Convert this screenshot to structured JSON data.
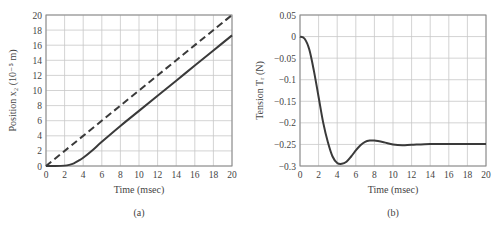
{
  "chart_data": [
    {
      "type": "line",
      "panel_label": "(a)",
      "title": "",
      "xlabel": "Time (msec)",
      "ylabel": "Position x₂ (10⁻⁵ m)",
      "xlim": [
        0,
        20
      ],
      "ylim": [
        0,
        20
      ],
      "xticks": [
        "0",
        "2",
        "4",
        "6",
        "8",
        "10",
        "12",
        "14",
        "16",
        "18",
        "20"
      ],
      "yticks": [
        "0",
        "2",
        "4",
        "6",
        "8",
        "10",
        "12",
        "14",
        "16",
        "18",
        "20"
      ],
      "grid": true,
      "legend": "none",
      "series": [
        {
          "name": "solid",
          "style": "solid",
          "x": [
            0,
            1,
            2,
            2.5,
            3,
            3.5,
            4,
            5,
            6,
            8,
            10,
            12,
            14,
            16,
            18,
            20
          ],
          "y": [
            0,
            0,
            0.05,
            0.15,
            0.35,
            0.7,
            1.1,
            2.1,
            3.2,
            5.3,
            7.3,
            9.3,
            11.3,
            13.3,
            15.3,
            17.3
          ]
        },
        {
          "name": "dashed",
          "style": "dashed",
          "x": [
            0,
            20
          ],
          "y": [
            0,
            20
          ]
        }
      ]
    },
    {
      "type": "line",
      "panel_label": "(b)",
      "title": "",
      "xlabel": "Time (msec)",
      "ylabel": "Tension Tᵣ (N)",
      "xlim": [
        0,
        20
      ],
      "ylim": [
        -0.3,
        0.05
      ],
      "xticks": [
        "0",
        "2",
        "4",
        "6",
        "8",
        "10",
        "12",
        "14",
        "16",
        "18",
        "20"
      ],
      "yticks": [
        "0.05",
        "0",
        "−0.05",
        "−0.1",
        "−0.15",
        "−0.2",
        "−0.25",
        "−0.3"
      ],
      "grid": true,
      "legend": "none",
      "series": [
        {
          "name": "tension",
          "style": "solid",
          "x": [
            0,
            0.5,
            1,
            1.5,
            2,
            2.5,
            3,
            3.5,
            4,
            4.5,
            5,
            5.5,
            6,
            6.5,
            7,
            7.5,
            8,
            9,
            10,
            11,
            12,
            14,
            16,
            18,
            20
          ],
          "y": [
            0,
            -0.005,
            -0.03,
            -0.08,
            -0.14,
            -0.2,
            -0.245,
            -0.278,
            -0.293,
            -0.295,
            -0.29,
            -0.278,
            -0.264,
            -0.252,
            -0.244,
            -0.241,
            -0.241,
            -0.245,
            -0.25,
            -0.252,
            -0.251,
            -0.249,
            -0.249,
            -0.249,
            -0.249
          ]
        }
      ]
    }
  ],
  "captions": {
    "a": "(a)",
    "b": "(b)"
  }
}
